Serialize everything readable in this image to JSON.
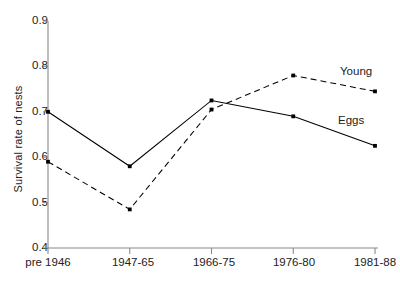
{
  "chart_data": {
    "type": "line",
    "title": "",
    "xlabel": "",
    "ylabel": "Survival rate of nests",
    "categories": [
      "pre 1946",
      "1947-65",
      "1966-75",
      "1976-80",
      "1981-88"
    ],
    "ylim": [
      0.4,
      0.9
    ],
    "yticks": [
      "0.4",
      "0.5",
      "0.6",
      "0.7",
      "0.8",
      "0.9"
    ],
    "ytick_values": [
      0.4,
      0.5,
      0.6,
      0.7,
      0.8,
      0.9
    ],
    "grid": false,
    "legend_position": "inline-right",
    "series": [
      {
        "name": "Eggs",
        "style": "solid",
        "marker": "square",
        "color": "#000000",
        "values": [
          0.7,
          0.58,
          0.725,
          0.69,
          0.625
        ]
      },
      {
        "name": "Young",
        "style": "dashed",
        "marker": "square",
        "color": "#000000",
        "values": [
          0.59,
          0.485,
          0.705,
          0.78,
          0.745
        ]
      }
    ],
    "annotations": [
      {
        "text": "Young",
        "series": "Young"
      },
      {
        "text": "Eggs",
        "series": "Eggs"
      }
    ]
  }
}
